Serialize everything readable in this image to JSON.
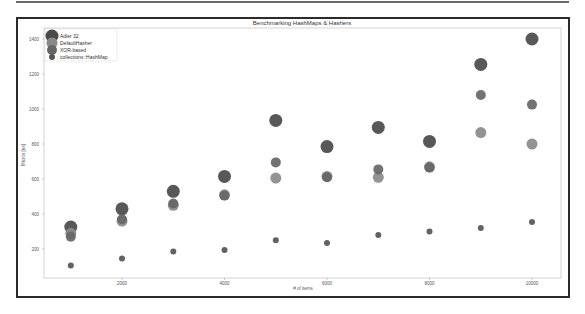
{
  "chart_data": {
    "type": "scatter",
    "title": "Benchmarking HashMaps & Hashers",
    "xlabel": "# of items",
    "ylabel": "Micros [ns]",
    "xlim": [
      500,
      10600
    ],
    "ylim": [
      20,
      1460
    ],
    "xticks": [
      2000,
      4000,
      6000,
      8000,
      10000
    ],
    "yticks": [
      200,
      400,
      600,
      800,
      1000,
      1200,
      1400
    ],
    "legend_position": "upper left",
    "grid": false,
    "x": [
      1000,
      2000,
      3000,
      4000,
      5000,
      6000,
      7000,
      8000,
      9000,
      10000
    ],
    "series": [
      {
        "name": "Adler 32",
        "color": "#4a4a4a",
        "size": 6.5,
        "values": [
          325,
          430,
          530,
          615,
          935,
          785,
          895,
          815,
          1255,
          1400
        ]
      },
      {
        "name": "DefaultHasher",
        "color": "#8a8a8a",
        "size": 5.5,
        "values": [
          290,
          360,
          450,
          510,
          605,
          615,
          610,
          670,
          865,
          800
        ]
      },
      {
        "name": "XOR-based",
        "color": "#666666",
        "size": 5,
        "values": [
          270,
          370,
          460,
          505,
          695,
          610,
          655,
          665,
          1080,
          1025
        ]
      },
      {
        "name": "collections::HashMap",
        "color": "#555555",
        "size": 3,
        "values": [
          105,
          145,
          185,
          195,
          250,
          235,
          280,
          300,
          320,
          355
        ]
      }
    ]
  },
  "labels": {
    "title": "Benchmarking HashMaps & Hashers",
    "xlabel": "# of items",
    "ylabel": "Micros [ns]",
    "xticks": [
      "2000",
      "4000",
      "6000",
      "8000",
      "10000"
    ],
    "yticks": [
      "1400",
      "1200",
      "1000",
      "800",
      "600",
      "400",
      "200"
    ],
    "legend": [
      "Adler 32",
      "DefaultHasher",
      "XOR-based",
      "collections::HashMap"
    ]
  }
}
